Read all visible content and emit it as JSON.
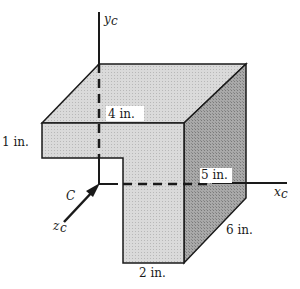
{
  "figure": {
    "type": "3D L-shaped solid with centroidal axes",
    "colors": {
      "top_face": "#d2d2d2",
      "front_face": "#d9d9d9",
      "side_face": "#a8a8a8",
      "edge": "#1a1a1a",
      "background": "#ffffff"
    }
  },
  "axes": {
    "y": {
      "label": "y",
      "subscript": "c"
    },
    "x": {
      "label": "x",
      "subscript": "c"
    },
    "z": {
      "label": "z",
      "subscript": "c"
    },
    "origin_label": "C"
  },
  "dimensions": {
    "top_thickness": "4 in.",
    "flange_height": "1 in.",
    "depth_label": "5 in.",
    "side_depth": "6 in.",
    "stem_width": "2 in."
  }
}
